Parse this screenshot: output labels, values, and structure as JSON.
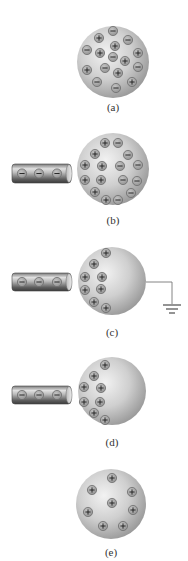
{
  "figure": {
    "colors": {
      "sphere_light": "#e4e4e4",
      "sphere_dark": "#9a9a9a",
      "charge_fill": "#a8a8a8",
      "charge_ring": "#7a7a7a",
      "glyph": "#1a1a1a",
      "rod_light": "#d8d8d8",
      "rod_dark": "#4a4a4a",
      "wire": "#777777"
    },
    "panels": [
      {
        "id": "a",
        "label": "(a)",
        "label_y": 101,
        "sphere": {
          "cx": 113,
          "cy": 62,
          "r": 36
        },
        "rod": null,
        "ground": false,
        "charges": [
          {
            "x": 99,
            "y": 38,
            "sign": "+"
          },
          {
            "x": 113,
            "y": 31,
            "sign": "-"
          },
          {
            "x": 128,
            "y": 40,
            "sign": "-"
          },
          {
            "x": 115,
            "y": 46,
            "sign": "+"
          },
          {
            "x": 87,
            "y": 50,
            "sign": "-"
          },
          {
            "x": 100,
            "y": 53,
            "sign": "+"
          },
          {
            "x": 113,
            "y": 57,
            "sign": "-"
          },
          {
            "x": 138,
            "y": 53,
            "sign": "+"
          },
          {
            "x": 125,
            "y": 61,
            "sign": "+"
          },
          {
            "x": 138,
            "y": 67,
            "sign": "-"
          },
          {
            "x": 87,
            "y": 70,
            "sign": "+"
          },
          {
            "x": 105,
            "y": 68,
            "sign": "-"
          },
          {
            "x": 118,
            "y": 73,
            "sign": "+"
          },
          {
            "x": 97,
            "y": 82,
            "sign": "-"
          },
          {
            "x": 132,
            "y": 82,
            "sign": "+"
          },
          {
            "x": 116,
            "y": 88,
            "sign": "-"
          }
        ]
      },
      {
        "id": "b",
        "label": "(b)",
        "label_y": 214,
        "sphere": {
          "cx": 113,
          "cy": 169,
          "r": 36
        },
        "rod": {
          "x": 12,
          "y": 164,
          "w": 59,
          "h": 19,
          "charges": [
            22,
            39,
            57
          ]
        },
        "ground": false,
        "charges": [
          {
            "x": 105,
            "y": 143,
            "sign": "+"
          },
          {
            "x": 118,
            "y": 143,
            "sign": "-"
          },
          {
            "x": 95,
            "y": 154,
            "sign": "+"
          },
          {
            "x": 128,
            "y": 155,
            "sign": "-"
          },
          {
            "x": 85,
            "y": 165,
            "sign": "+"
          },
          {
            "x": 102,
            "y": 166,
            "sign": "+"
          },
          {
            "x": 120,
            "y": 166,
            "sign": "-"
          },
          {
            "x": 138,
            "y": 165,
            "sign": "-"
          },
          {
            "x": 85,
            "y": 180,
            "sign": "+"
          },
          {
            "x": 101,
            "y": 180,
            "sign": "+"
          },
          {
            "x": 123,
            "y": 180,
            "sign": "-"
          },
          {
            "x": 137,
            "y": 181,
            "sign": "-"
          },
          {
            "x": 95,
            "y": 192,
            "sign": "+"
          },
          {
            "x": 131,
            "y": 193,
            "sign": "-"
          },
          {
            "x": 106,
            "y": 200,
            "sign": "+"
          },
          {
            "x": 118,
            "y": 200,
            "sign": "-"
          }
        ]
      },
      {
        "id": "c",
        "label": "(c)",
        "label_y": 326,
        "sphere": {
          "cx": 112,
          "cy": 281,
          "r": 34
        },
        "rod": {
          "x": 12,
          "y": 273,
          "w": 59,
          "h": 18,
          "charges": [
            22,
            39,
            57
          ]
        },
        "ground": true,
        "ground_wire": {
          "x1": 146,
          "y": 282,
          "x2": 172,
          "y2": 304
        },
        "charges": [
          {
            "x": 106,
            "y": 253,
            "sign": "+"
          },
          {
            "x": 94,
            "y": 264,
            "sign": "+"
          },
          {
            "x": 85,
            "y": 277,
            "sign": "+"
          },
          {
            "x": 102,
            "y": 277,
            "sign": "+"
          },
          {
            "x": 85,
            "y": 290,
            "sign": "+"
          },
          {
            "x": 101,
            "y": 289,
            "sign": "+"
          },
          {
            "x": 94,
            "y": 302,
            "sign": "+"
          },
          {
            "x": 106,
            "y": 308,
            "sign": "+"
          }
        ]
      },
      {
        "id": "d",
        "label": "(d)",
        "label_y": 436,
        "sphere": {
          "cx": 112,
          "cy": 391,
          "r": 34
        },
        "rod": {
          "x": 12,
          "y": 386,
          "w": 59,
          "h": 18,
          "charges": [
            22,
            39,
            57
          ]
        },
        "ground": false,
        "charges": [
          {
            "x": 105,
            "y": 365,
            "sign": "+"
          },
          {
            "x": 94,
            "y": 376,
            "sign": "+"
          },
          {
            "x": 84,
            "y": 387,
            "sign": "+"
          },
          {
            "x": 101,
            "y": 388,
            "sign": "+"
          },
          {
            "x": 84,
            "y": 402,
            "sign": "+"
          },
          {
            "x": 100,
            "y": 402,
            "sign": "+"
          },
          {
            "x": 94,
            "y": 413,
            "sign": "+"
          },
          {
            "x": 105,
            "y": 420,
            "sign": "+"
          }
        ]
      },
      {
        "id": "e",
        "label": "(e)",
        "label_y": 546,
        "sphere": {
          "cx": 111,
          "cy": 504,
          "r": 35
        },
        "rod": null,
        "ground": false,
        "charges": [
          {
            "x": 112,
            "y": 478,
            "sign": "+"
          },
          {
            "x": 92,
            "y": 490,
            "sign": "+"
          },
          {
            "x": 132,
            "y": 492,
            "sign": "+"
          },
          {
            "x": 112,
            "y": 503,
            "sign": "+"
          },
          {
            "x": 88,
            "y": 512,
            "sign": "+"
          },
          {
            "x": 133,
            "y": 510,
            "sign": "+"
          },
          {
            "x": 103,
            "y": 526,
            "sign": "+"
          },
          {
            "x": 123,
            "y": 526,
            "sign": "+"
          }
        ]
      }
    ]
  }
}
